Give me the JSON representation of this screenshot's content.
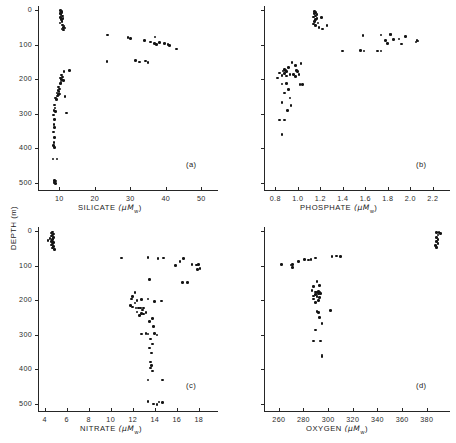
{
  "figure": {
    "ylabel": "DEPTH  (m)",
    "y_ticks": [
      0,
      100,
      200,
      300,
      400,
      500
    ],
    "y_range": [
      0,
      520
    ]
  },
  "chart_data": [
    {
      "type": "scatter",
      "tag": "(a)",
      "xlabel": "SILICATE",
      "xunit": "(μM",
      "xunit_sub": "w",
      "xunit_end": ")",
      "x_ticks": [
        10,
        20,
        30,
        40,
        50
      ],
      "xlim": [
        4,
        53
      ],
      "ylabel": "DEPTH  (m)",
      "ylim": [
        0,
        520
      ],
      "y_ticks": [
        0,
        100,
        200,
        300,
        400,
        500
      ],
      "y_tick_labels": [
        "0",
        "100",
        "200",
        "300",
        "400",
        "500"
      ],
      "points": [
        [
          10.4,
          2
        ],
        [
          10.7,
          4
        ],
        [
          10.6,
          7
        ],
        [
          10.2,
          10
        ],
        [
          10.5,
          13
        ],
        [
          10.9,
          17
        ],
        [
          10.3,
          21
        ],
        [
          11.0,
          25
        ],
        [
          10.6,
          28
        ],
        [
          10.8,
          33
        ],
        [
          10.2,
          38
        ],
        [
          10.9,
          43
        ],
        [
          11.3,
          46
        ],
        [
          11.1,
          50
        ],
        [
          11.6,
          52
        ],
        [
          10.8,
          55
        ],
        [
          11.2,
          58
        ],
        [
          23.6,
          72
        ],
        [
          29.3,
          80
        ],
        [
          30.1,
          83
        ],
        [
          37.0,
          78
        ],
        [
          34.0,
          88
        ],
        [
          35.6,
          92
        ],
        [
          36.8,
          96
        ],
        [
          38.2,
          94
        ],
        [
          37.4,
          100
        ],
        [
          39.6,
          97
        ],
        [
          40.6,
          99
        ],
        [
          41.0,
          103
        ],
        [
          43.0,
          113
        ],
        [
          23.4,
          148
        ],
        [
          31.5,
          146
        ],
        [
          32.6,
          150
        ],
        [
          34.2,
          147
        ],
        [
          35.0,
          152
        ],
        [
          11.3,
          178
        ],
        [
          12.8,
          174
        ],
        [
          10.6,
          188
        ],
        [
          10.9,
          193
        ],
        [
          10.4,
          196
        ],
        [
          10.7,
          200
        ],
        [
          11.2,
          204
        ],
        [
          10.5,
          208
        ],
        [
          10.3,
          213
        ],
        [
          9.8,
          222
        ],
        [
          10.0,
          228
        ],
        [
          9.6,
          232
        ],
        [
          9.9,
          236
        ],
        [
          9.4,
          240
        ],
        [
          9.7,
          244
        ],
        [
          10.1,
          243
        ],
        [
          9.5,
          248
        ],
        [
          11.6,
          250
        ],
        [
          8.9,
          254
        ],
        [
          9.2,
          258
        ],
        [
          8.6,
          274
        ],
        [
          8.8,
          283
        ],
        [
          8.5,
          290
        ],
        [
          8.9,
          294
        ],
        [
          12.1,
          297
        ],
        [
          8.4,
          303
        ],
        [
          8.6,
          316
        ],
        [
          8.5,
          330
        ],
        [
          8.7,
          339
        ],
        [
          8.3,
          352
        ],
        [
          8.6,
          368
        ],
        [
          8.5,
          382
        ],
        [
          8.4,
          392
        ],
        [
          8.6,
          398
        ],
        [
          8.2,
          430
        ],
        [
          9.3,
          431
        ],
        [
          8.6,
          492
        ],
        [
          8.9,
          494
        ],
        [
          8.5,
          497
        ],
        [
          8.7,
          500
        ],
        [
          9.0,
          502
        ]
      ]
    },
    {
      "type": "scatter",
      "tag": "(b)",
      "xlabel": "PHOSPHATE",
      "xunit": "(μM",
      "xunit_sub": "w",
      "xunit_end": ")",
      "x_ticks": [
        0.8,
        1.0,
        1.2,
        1.4,
        1.6,
        1.8,
        2.0,
        2.2
      ],
      "x_tick_labels": [
        "0.8",
        "1.0",
        "1.2",
        "1.4",
        "1.6",
        "1.8",
        "2.0",
        "2.2"
      ],
      "xlim": [
        0.7,
        2.3
      ],
      "ylim": [
        0,
        520
      ],
      "y_ticks": [
        0,
        100,
        200,
        300,
        400,
        500
      ],
      "points": [
        [
          1.15,
          4
        ],
        [
          1.16,
          7
        ],
        [
          1.15,
          10
        ],
        [
          1.17,
          13
        ],
        [
          1.16,
          17
        ],
        [
          1.14,
          20
        ],
        [
          1.17,
          24
        ],
        [
          1.16,
          28
        ],
        [
          1.15,
          33
        ],
        [
          1.18,
          37
        ],
        [
          1.14,
          41
        ],
        [
          1.16,
          45
        ],
        [
          1.21,
          22
        ],
        [
          1.19,
          50
        ],
        [
          1.26,
          44
        ],
        [
          1.22,
          55
        ],
        [
          1.58,
          73
        ],
        [
          1.74,
          72
        ],
        [
          1.82,
          70
        ],
        [
          1.83,
          71
        ],
        [
          1.96,
          76
        ],
        [
          1.78,
          88
        ],
        [
          1.85,
          86
        ],
        [
          1.9,
          84
        ],
        [
          2.06,
          88
        ],
        [
          2.07,
          90
        ],
        [
          2.05,
          93
        ],
        [
          1.8,
          96
        ],
        [
          1.92,
          98
        ],
        [
          1.4,
          118
        ],
        [
          1.56,
          117
        ],
        [
          1.59,
          118
        ],
        [
          1.71,
          119
        ],
        [
          1.74,
          119
        ],
        [
          0.95,
          152
        ],
        [
          0.98,
          160
        ],
        [
          1.03,
          155
        ],
        [
          0.92,
          166
        ],
        [
          0.88,
          172
        ],
        [
          0.89,
          175
        ],
        [
          0.9,
          178
        ],
        [
          0.87,
          176
        ],
        [
          0.99,
          174
        ],
        [
          1.0,
          178
        ],
        [
          0.84,
          182
        ],
        [
          0.88,
          184
        ],
        [
          0.93,
          186
        ],
        [
          0.96,
          186
        ],
        [
          1.01,
          186
        ],
        [
          0.86,
          190
        ],
        [
          0.9,
          191
        ],
        [
          0.98,
          192
        ],
        [
          0.82,
          196
        ],
        [
          0.86,
          214
        ],
        [
          0.9,
          212
        ],
        [
          1.02,
          216
        ],
        [
          1.04,
          216
        ],
        [
          0.92,
          230
        ],
        [
          0.88,
          240
        ],
        [
          0.93,
          254
        ],
        [
          0.86,
          268
        ],
        [
          0.94,
          276
        ],
        [
          0.91,
          290
        ],
        [
          0.84,
          318
        ],
        [
          0.88,
          318
        ],
        [
          0.86,
          360
        ]
      ]
    },
    {
      "type": "scatter",
      "tag": "(c)",
      "xlabel": "NITRATE",
      "xunit": "(μM",
      "xunit_sub": "w",
      "xunit_end": ")",
      "x_ticks": [
        4,
        6,
        8,
        10,
        12,
        14,
        16,
        18
      ],
      "xlim": [
        3.4,
        19.2
      ],
      "ylim": [
        0,
        520
      ],
      "y_ticks": [
        0,
        100,
        200,
        300,
        400,
        500
      ],
      "y_tick_labels": [
        "0",
        "100",
        "200",
        "300",
        "400",
        "500"
      ],
      "points": [
        [
          4.7,
          3
        ],
        [
          4.6,
          6
        ],
        [
          4.8,
          9
        ],
        [
          4.7,
          12
        ],
        [
          4.6,
          15
        ],
        [
          4.8,
          18
        ],
        [
          4.5,
          21
        ],
        [
          4.7,
          24
        ],
        [
          4.3,
          27
        ],
        [
          4.6,
          30
        ],
        [
          4.8,
          33
        ],
        [
          4.7,
          37
        ],
        [
          4.6,
          41
        ],
        [
          4.8,
          45
        ],
        [
          4.7,
          49
        ],
        [
          4.9,
          53
        ],
        [
          11.0,
          78
        ],
        [
          13.4,
          77
        ],
        [
          14.3,
          79
        ],
        [
          14.8,
          78
        ],
        [
          16.3,
          88
        ],
        [
          16.6,
          80
        ],
        [
          15.9,
          100
        ],
        [
          17.4,
          96
        ],
        [
          17.8,
          98
        ],
        [
          18.0,
          97
        ],
        [
          18.1,
          108
        ],
        [
          17.9,
          112
        ],
        [
          13.5,
          140
        ],
        [
          16.5,
          148
        ],
        [
          17.0,
          148
        ],
        [
          12.2,
          178
        ],
        [
          12.0,
          190
        ],
        [
          11.9,
          196
        ],
        [
          12.4,
          200
        ],
        [
          12.8,
          198
        ],
        [
          13.4,
          196
        ],
        [
          14.0,
          204
        ],
        [
          12.2,
          208
        ],
        [
          11.8,
          216
        ],
        [
          12.0,
          220
        ],
        [
          12.3,
          222
        ],
        [
          12.5,
          222
        ],
        [
          12.7,
          223
        ],
        [
          13.0,
          222
        ],
        [
          12.9,
          228
        ],
        [
          12.4,
          234
        ],
        [
          12.8,
          238
        ],
        [
          13.0,
          240
        ],
        [
          12.6,
          244
        ],
        [
          13.2,
          236
        ],
        [
          14.6,
          202
        ],
        [
          13.8,
          252
        ],
        [
          13.5,
          262
        ],
        [
          13.9,
          276
        ],
        [
          12.8,
          298
        ],
        [
          13.2,
          296
        ],
        [
          13.4,
          298
        ],
        [
          14.0,
          296
        ],
        [
          14.2,
          300
        ],
        [
          13.6,
          312
        ],
        [
          13.8,
          326
        ],
        [
          13.5,
          338
        ],
        [
          13.7,
          352
        ],
        [
          13.6,
          378
        ],
        [
          13.7,
          388
        ],
        [
          13.6,
          396
        ],
        [
          13.8,
          404
        ],
        [
          13.4,
          430
        ],
        [
          14.7,
          430
        ],
        [
          13.4,
          492
        ],
        [
          13.9,
          500
        ],
        [
          14.4,
          494
        ],
        [
          14.2,
          502
        ],
        [
          14.7,
          496
        ]
      ]
    },
    {
      "type": "scatter",
      "tag": "(d)",
      "xlabel": "OXYGEN",
      "xunit": "(μM",
      "xunit_sub": "w",
      "xunit_end": ")",
      "x_ticks": [
        260,
        280,
        300,
        320,
        340,
        360,
        380
      ],
      "xlim": [
        248,
        394
      ],
      "ylim": [
        0,
        520
      ],
      "y_ticks": [
        0,
        100,
        200,
        300,
        400,
        500
      ],
      "points": [
        [
          388,
          5
        ],
        [
          390,
          4
        ],
        [
          391,
          8
        ],
        [
          389,
          12
        ],
        [
          388,
          18
        ],
        [
          389,
          24
        ],
        [
          388,
          30
        ],
        [
          389,
          36
        ],
        [
          387,
          42
        ],
        [
          388,
          48
        ],
        [
          262,
          96
        ],
        [
          270,
          98
        ],
        [
          271,
          96
        ],
        [
          271,
          106
        ],
        [
          276,
          88
        ],
        [
          281,
          82
        ],
        [
          284,
          84
        ],
        [
          286,
          82
        ],
        [
          290,
          78
        ],
        [
          303,
          74
        ],
        [
          307,
          72
        ],
        [
          310,
          73
        ],
        [
          291,
          146
        ],
        [
          288,
          160
        ],
        [
          293,
          158
        ],
        [
          287,
          172
        ],
        [
          290,
          176
        ],
        [
          292,
          174
        ],
        [
          291,
          178
        ],
        [
          293,
          178
        ],
        [
          292,
          182
        ],
        [
          290,
          184
        ],
        [
          294,
          180
        ],
        [
          288,
          188
        ],
        [
          291,
          190
        ],
        [
          293,
          192
        ],
        [
          288,
          196
        ],
        [
          292,
          200
        ],
        [
          290,
          206
        ],
        [
          291,
          232
        ],
        [
          292,
          236
        ],
        [
          302,
          230
        ],
        [
          293,
          250
        ],
        [
          295,
          268
        ],
        [
          290,
          286
        ],
        [
          288,
          318
        ],
        [
          294,
          318
        ],
        [
          295,
          358
        ],
        [
          295,
          362
        ]
      ]
    }
  ]
}
